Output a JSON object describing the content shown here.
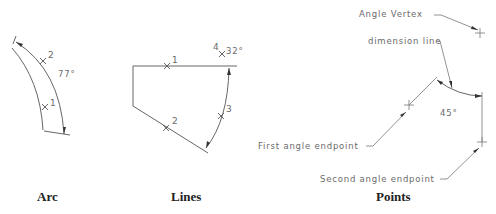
{
  "panels": [
    {
      "id": "arc",
      "caption": "Arc",
      "points": [
        {
          "label": "1"
        },
        {
          "label": "2"
        }
      ],
      "angle_label": "77°"
    },
    {
      "id": "lines",
      "caption": "Lines",
      "points": [
        {
          "label": "1"
        },
        {
          "label": "2"
        },
        {
          "label": "3"
        },
        {
          "label": "4"
        }
      ],
      "angle_label": "32°"
    },
    {
      "id": "points",
      "caption": "Points",
      "angle_label": "45°",
      "callouts": {
        "vertex": "Angle Vertex",
        "dimension_line": "dimension line",
        "first_endpoint": "First angle endpoint",
        "second_endpoint": "Second angle endpoint"
      }
    }
  ],
  "colors": {
    "line": "#555555",
    "text": "#6a6a6a",
    "caption": "#222222"
  }
}
